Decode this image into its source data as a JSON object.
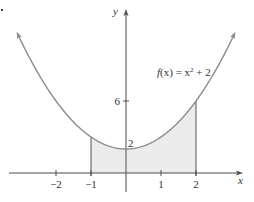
{
  "chart_data": {
    "type": "line",
    "title": "",
    "function_label": "f(x) = x² + 2",
    "function_parts": {
      "f": "f",
      "arg": "(x) = x",
      "exp": "2",
      "tail": " + 2"
    },
    "xlabel": "x",
    "ylabel": "y",
    "x_range": [
      -3.1,
      3.1
    ],
    "xlim": [
      -3.4,
      3.3
    ],
    "ylim": [
      -1.6,
      13.6
    ],
    "x_ticks": [
      {
        "value": -2,
        "label": "−2"
      },
      {
        "value": -1,
        "label": "−1"
      },
      {
        "value": 1,
        "label": "1"
      },
      {
        "value": 2,
        "label": "2"
      }
    ],
    "y_ticks": [
      {
        "value": 6,
        "label": "6"
      }
    ],
    "annotations": [
      {
        "text": "2",
        "x": 0,
        "y": 2,
        "note": "y-intercept label"
      }
    ],
    "shaded_region": {
      "from": -1,
      "to": 2,
      "description": "area under f(x) from x = -1 to x = 2"
    },
    "series": [
      {
        "name": "f(x) = x^2 + 2",
        "x": [
          -3,
          -2.5,
          -2,
          -1.5,
          -1,
          -0.5,
          0,
          0.5,
          1,
          1.5,
          2,
          2.5,
          3
        ],
        "y": [
          11,
          8.25,
          6,
          4.25,
          3,
          2.25,
          2,
          2.25,
          3,
          4.25,
          6,
          8.25,
          11
        ]
      }
    ],
    "grid": false,
    "legend": "none",
    "colors": {
      "curve": "#8c8c8c",
      "axes": "#4d4d4d",
      "shade": "#ececec",
      "bounds": "#555555"
    }
  }
}
